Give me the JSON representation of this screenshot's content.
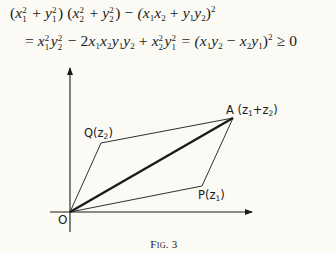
{
  "equation": {
    "line1": {
      "part1_open": "(",
      "x1": "x",
      "x1_sup": "2",
      "x1_sub": "1",
      "plus1": " + ",
      "y1": "y",
      "y1_sup": "2",
      "y1_sub": "1",
      "part1_close": ")",
      "part2_open": " (",
      "x2": "x",
      "x2_sup": "2",
      "x2_sub": "2",
      "plus2": " + ",
      "y2": "y",
      "y2_sup": "2",
      "y2_sub": "2",
      "part2_close": ")",
      "minus": " − ",
      "part3": "(x",
      "p3_sub1": "1",
      "p3_x": "x",
      "p3_sub2": "2",
      "p3_plus": " + ",
      "p3_y": "y",
      "p3_sub3": "1",
      "p3_y2": "y",
      "p3_sub4": "2",
      "p3_close": ")",
      "p3_sup": "2"
    },
    "line2": {
      "eq": "= ",
      "t1_x": "x",
      "t1_x_sup": "2",
      "t1_x_sub": "1",
      "t1_y": "y",
      "t1_y_sup": "2",
      "t1_y_sub": "2",
      "minus": " − 2",
      "t2_x1": "x",
      "t2_s1": "1",
      "t2_x2": "x",
      "t2_s2": "2",
      "t2_y1": "y",
      "t2_s3": "1",
      "t2_y2": "y",
      "t2_s4": "2",
      "plus": " + ",
      "t3_x": "x",
      "t3_x_sup": "2",
      "t3_x_sub": "2",
      "t3_y": "y",
      "t3_y_sup": "2",
      "t3_y_sub": "1",
      "eq2": " = ",
      "t4_open": "(x",
      "t4_s1": "1",
      "t4_y": "y",
      "t4_s2": "2",
      "t4_minus": " − ",
      "t4_x": "x",
      "t4_s3": "2",
      "t4_y2": "y",
      "t4_s4": "1",
      "t4_close": ")",
      "t4_sup": "2",
      "geq": " ≥ ",
      "zero": "0"
    }
  },
  "figure": {
    "labels": {
      "origin": "O",
      "a_letter": "A",
      "a_paren_open": " (z",
      "a_sub1": "1",
      "a_plus": "+z",
      "a_sub2": "2",
      "a_paren_close": ")",
      "q_letter": "Q",
      "q_paren_open": "(z",
      "q_sub": "2",
      "q_paren_close": ")",
      "p_letter": "P",
      "p_paren_open": "(z",
      "p_sub": "1",
      "p_paren_close": ")"
    },
    "caption": "Fig. 3",
    "points": {
      "O": [
        70,
        212
      ],
      "P": [
        202,
        186
      ],
      "Q": [
        101,
        143
      ],
      "A": [
        233,
        118
      ]
    },
    "axes": {
      "x_axis": {
        "from": [
          50,
          212
        ],
        "to": [
          252,
          212
        ]
      },
      "y_axis": {
        "from": [
          70,
          232
        ],
        "to": [
          70,
          68
        ]
      }
    },
    "colors": {
      "ink": "#1a1a1a",
      "background": "#fbfaf5"
    }
  }
}
